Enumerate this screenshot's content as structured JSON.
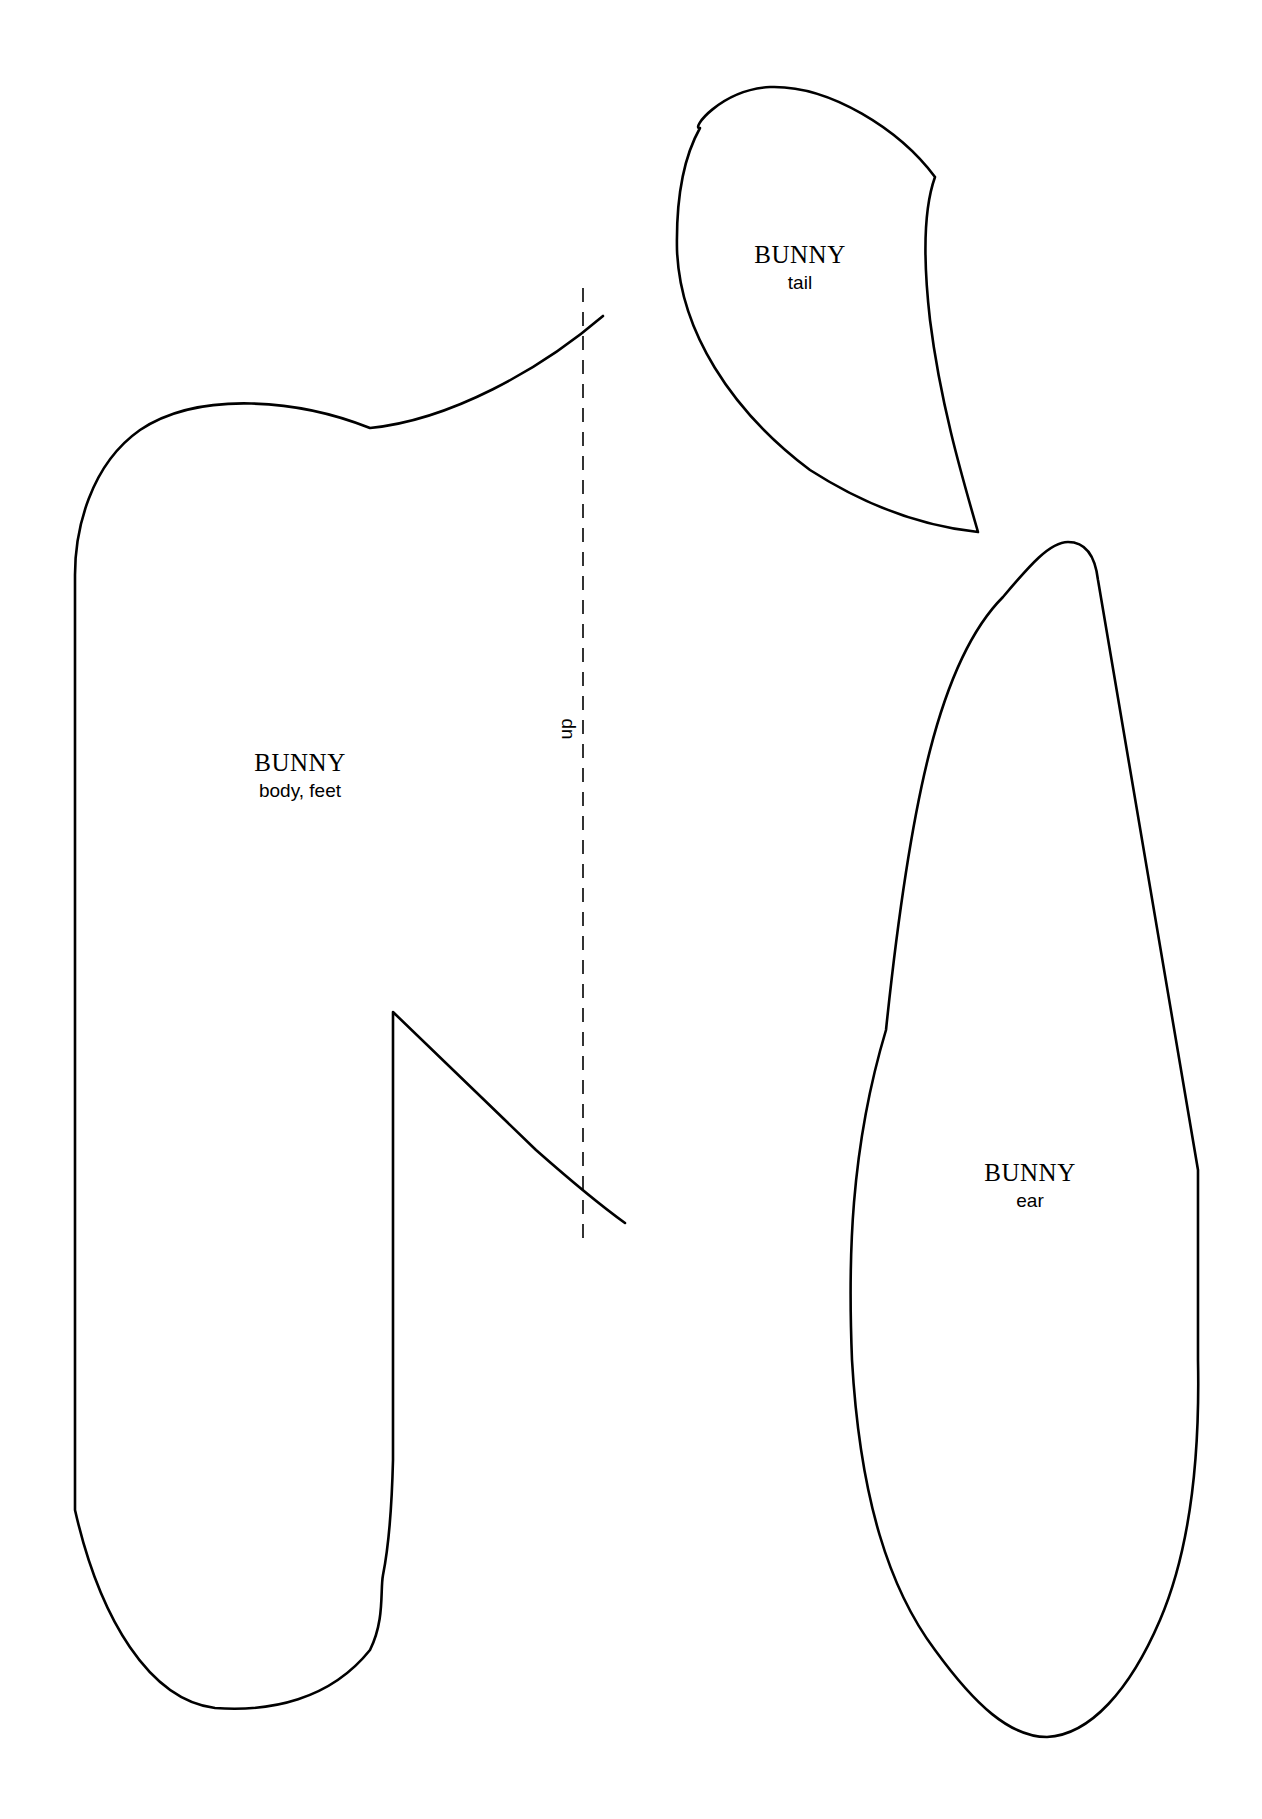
{
  "document": {
    "type": "sewing pattern sheet",
    "pieces": [
      {
        "id": "body",
        "title": "BUNNY",
        "subtitle": "body, feet"
      },
      {
        "id": "tail",
        "title": "BUNNY",
        "subtitle": "tail"
      },
      {
        "id": "ear",
        "title": "BUNNY",
        "subtitle": "ear"
      }
    ],
    "fold_line": {
      "label": "up",
      "style": "dashed"
    },
    "colors": {
      "background": "#ffffff",
      "stroke": "#000000"
    }
  }
}
